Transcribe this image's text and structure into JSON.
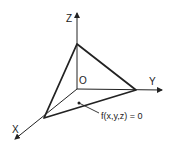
{
  "diagram": {
    "title": "",
    "axes": {
      "x_label": "X",
      "y_label": "Y",
      "z_label": "Z",
      "origin_label": "O"
    },
    "surface_label": "f(x,y,z) = 0",
    "colors": {
      "stroke": "#222222",
      "background": "#ffffff"
    }
  }
}
